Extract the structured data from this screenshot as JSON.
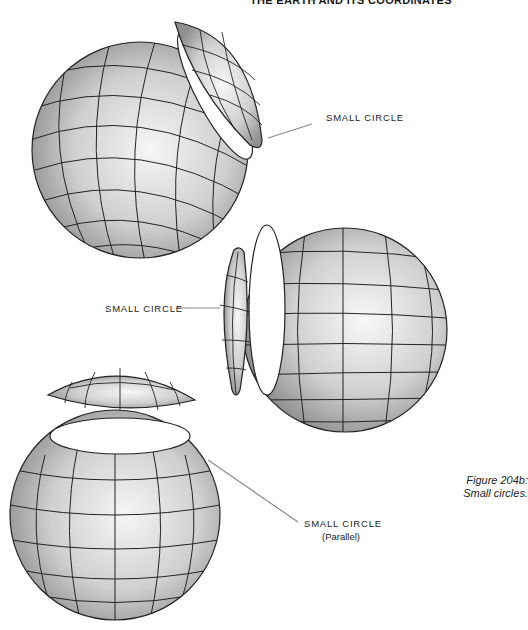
{
  "header": {
    "title": "THE EARTH AND ITS COORDINATES"
  },
  "figure": {
    "caption_line1": "Figure 204b:",
    "caption_line2": "Small circles."
  },
  "labels": [
    {
      "text": "SMALL CIRCLE",
      "sub": ""
    },
    {
      "text": "SMALL CIRCLE",
      "sub": ""
    },
    {
      "text": "SMALL CIRCLE",
      "sub": "(Parallel)"
    }
  ],
  "illustrations": [
    {
      "name": "globe-top",
      "description": "Sphere with oblique small-circle cap removed"
    },
    {
      "name": "globe-middle",
      "description": "Sphere with side small-circle cap removed"
    },
    {
      "name": "globe-bottom",
      "description": "Sphere with polar cap removed along a parallel"
    }
  ],
  "colors": {
    "line": "#222222",
    "leader": "#8a8a8a",
    "shade_light": "#f4f4f4",
    "shade_dark": "#9a9a9a"
  }
}
